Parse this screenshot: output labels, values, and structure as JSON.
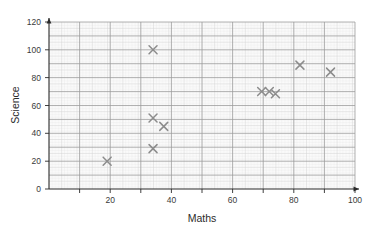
{
  "chart_data": {
    "type": "scatter",
    "title": "",
    "xlabel": "Maths",
    "ylabel": "Science",
    "xlim": [
      0,
      100
    ],
    "ylim": [
      0,
      120
    ],
    "xticks": [
      20,
      40,
      60,
      80,
      100
    ],
    "yticks": [
      0,
      20,
      40,
      60,
      80,
      100,
      120
    ],
    "xtick_labels": [
      "20",
      "40",
      "60",
      "80",
      "100"
    ],
    "ytick_labels": [
      "0",
      "20",
      "40",
      "60",
      "80",
      "100",
      "120"
    ],
    "grid": true,
    "grid_style": "graph-paper",
    "minor_grid_step": 2,
    "major_grid_step": 10,
    "legend": false,
    "marker": "x",
    "marker_color": "#8c8c8c",
    "points": [
      {
        "x": 19,
        "y": 20
      },
      {
        "x": 34,
        "y": 100
      },
      {
        "x": 34,
        "y": 51
      },
      {
        "x": 37.5,
        "y": 45
      },
      {
        "x": 34,
        "y": 29
      },
      {
        "x": 69.5,
        "y": 70
      },
      {
        "x": 72,
        "y": 70
      },
      {
        "x": 74,
        "y": 68.5
      },
      {
        "x": 82,
        "y": 89
      },
      {
        "x": 92,
        "y": 84
      }
    ]
  },
  "axes": {
    "x_label": "Maths",
    "y_label": "Science"
  },
  "colors": {
    "background": "#ffffff",
    "plot_background": "#fbfbfb",
    "minor_grid": "#dedede",
    "major_grid": "#9a9a9a",
    "axis": "#2b2b2b",
    "marker": "#8c8c8c",
    "text": "#2b2b2b"
  }
}
